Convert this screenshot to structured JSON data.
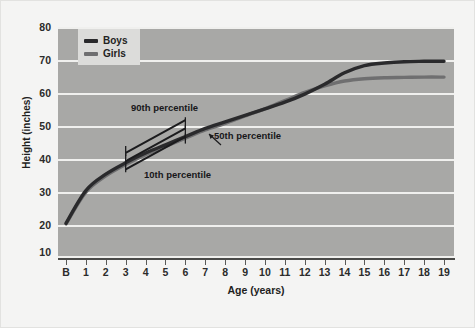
{
  "chart_data": {
    "type": "line",
    "title": "",
    "xlabel": "Age (years)",
    "ylabel": "Height (inches)",
    "xlim": [
      0,
      19
    ],
    "ylim": [
      10,
      80
    ],
    "xtick_labels": [
      "B",
      "1",
      "2",
      "3",
      "4",
      "5",
      "6",
      "7",
      "8",
      "9",
      "10",
      "11",
      "12",
      "13",
      "14",
      "15",
      "16",
      "17",
      "18",
      "19"
    ],
    "ytick_labels": [
      "10",
      "20",
      "30",
      "40",
      "50",
      "60",
      "70",
      "80"
    ],
    "ytick_values": [
      10,
      20,
      30,
      40,
      50,
      60,
      70,
      80
    ],
    "grid": "horizontal",
    "legend_position": "top-left",
    "series": [
      {
        "name": "Boys",
        "color": "#2a2a2c",
        "x": [
          0,
          1,
          2,
          3,
          4,
          5,
          6,
          7,
          8,
          9,
          10,
          11,
          12,
          13,
          14,
          15,
          16,
          17,
          18,
          19
        ],
        "values": [
          20.0,
          30.0,
          35.0,
          38.5,
          41.5,
          44.0,
          46.5,
          49.0,
          51.0,
          53.0,
          55.0,
          57.0,
          59.5,
          62.5,
          66.0,
          68.2,
          69.0,
          69.4,
          69.5,
          69.5
        ]
      },
      {
        "name": "Girls",
        "color": "#6f6f70",
        "x": [
          0,
          1,
          2,
          3,
          4,
          5,
          6,
          7,
          8,
          9,
          10,
          11,
          12,
          13,
          14,
          15,
          16,
          17,
          18,
          19
        ],
        "values": [
          19.8,
          29.5,
          34.5,
          38.0,
          41.0,
          43.5,
          46.0,
          48.5,
          50.5,
          52.8,
          55.0,
          57.5,
          60.0,
          62.0,
          63.5,
          64.2,
          64.5,
          64.6,
          64.7,
          64.7
        ]
      }
    ],
    "annotations": [
      {
        "label": "90th percentile",
        "x_start": 3,
        "x_end": 6,
        "y_start": 41.5,
        "y_end": 51.5
      },
      {
        "label": "50th percentile",
        "x_start": 3,
        "x_end": 6,
        "y_start": 39.0,
        "y_end": 49.0
      },
      {
        "label": "10th percentile",
        "x_start": 3,
        "x_end": 6,
        "y_start": 36.5,
        "y_end": 46.5
      }
    ]
  },
  "legend": {
    "items": [
      {
        "label": "Boys",
        "color": "#2a2a2c"
      },
      {
        "label": "Girls",
        "color": "#6f6f70"
      }
    ]
  },
  "axes": {
    "y_title": "Height (inches)",
    "x_title": "Age (years)"
  },
  "annotations": {
    "p90": "90th percentile",
    "p50": "50th percentile",
    "p10": "10th percentile"
  },
  "colors": {
    "plot_background": "#a8a8a6",
    "figure_background": "#f4f4f3",
    "gridline": "#f0f0ee",
    "axis": "#4a4a48",
    "boys": "#2a2a2c",
    "girls": "#6f6f70",
    "legend_background": "#dcdcda"
  }
}
